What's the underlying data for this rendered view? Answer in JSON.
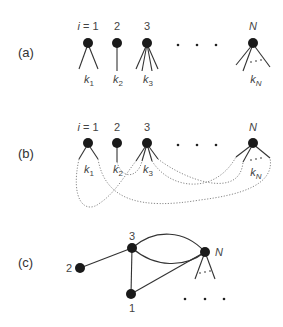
{
  "panels": {
    "a": {
      "label": "(a)",
      "node_labels": [
        "i = 1",
        "2",
        "3",
        "N"
      ],
      "stub_labels": [
        "k",
        "k",
        "k",
        "k"
      ],
      "stub_subscripts": [
        "1",
        "2",
        "3",
        "N"
      ],
      "ellipsis": "• • •",
      "stub_ellipsis": ". . ."
    },
    "b": {
      "label": "(b)",
      "node_labels": [
        "i = 1",
        "2",
        "3",
        "N"
      ],
      "stub_labels": [
        "k",
        "k",
        "k",
        "k"
      ],
      "stub_subscripts": [
        "1",
        "2",
        "3",
        "N"
      ],
      "ellipsis": "• • •",
      "stub_ellipsis": ". . ."
    },
    "c": {
      "label": "(c)",
      "node_labels": [
        "3",
        "2",
        "1",
        "N"
      ],
      "ellipsis": "• • •",
      "stub_ellipsis": ". . ."
    }
  },
  "colors": {
    "node": "#1a1a1a",
    "edge": "#333333",
    "dashed_edge": "#888888"
  }
}
